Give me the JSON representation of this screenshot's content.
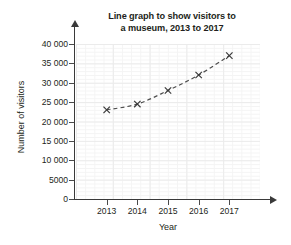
{
  "chart_data": {
    "type": "line",
    "title": "Line graph to show visitors to a museum, 2013 to 2017",
    "title_line1": "Line graph to show visitors to",
    "title_line2": "a museum, 2013 to 2017",
    "xlabel": "Year",
    "ylabel": "Number of visitors",
    "categories": [
      "2013",
      "2014",
      "2015",
      "2016",
      "2017"
    ],
    "x": [
      2013,
      2014,
      2015,
      2016,
      2017
    ],
    "values": [
      23000,
      24500,
      28000,
      32000,
      37000
    ],
    "series": [
      {
        "name": "Number of visitors",
        "values": [
          23000,
          24500,
          28000,
          32000,
          37000
        ],
        "marker": "x-cross",
        "line_style": "dashed",
        "line_color": "#4d4d4d",
        "marker_color": "#3a3a3a"
      }
    ],
    "ylim": [
      0,
      40000
    ],
    "ytick_values": [
      0,
      5000,
      10000,
      15000,
      20000,
      25000,
      30000,
      35000,
      40000
    ],
    "ytick_labels": [
      "0",
      "5000",
      "10 000",
      "15 000",
      "20 000",
      "25 000",
      "30 000",
      "35 000",
      "40 000"
    ],
    "xtick_labels": [
      "2013",
      "2014",
      "2015",
      "2016",
      "2017"
    ],
    "grid": true,
    "grid_major_color": "#ebebeb",
    "grid_minor_color": "#f4f4f4",
    "legend": "none",
    "axis_color": "#3a3a3a",
    "background_color": "#ffffff"
  }
}
